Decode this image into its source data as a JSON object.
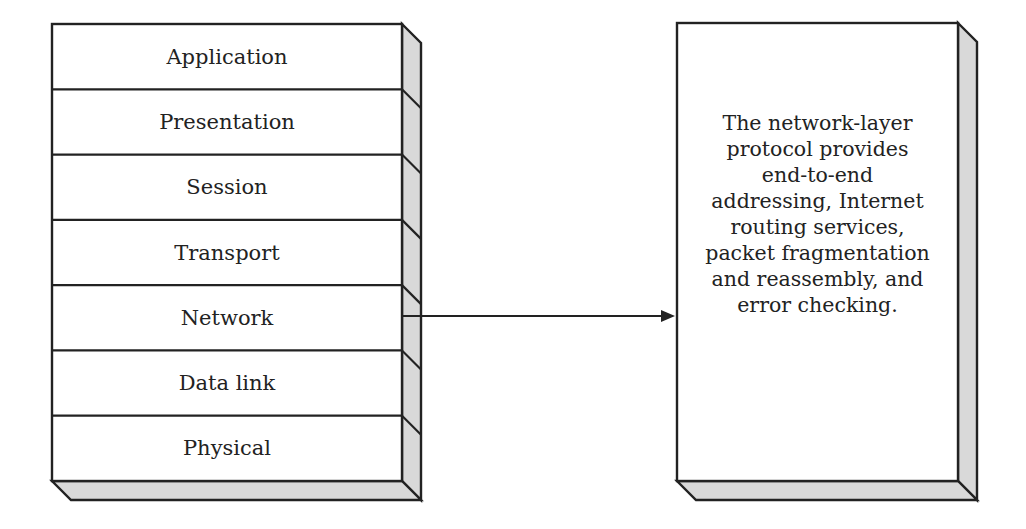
{
  "diagram": {
    "stack": {
      "name": "osi-layer-stack",
      "layers": [
        {
          "label": "Application"
        },
        {
          "label": "Presentation"
        },
        {
          "label": "Session"
        },
        {
          "label": "Transport"
        },
        {
          "label": "Network"
        },
        {
          "label": "Data link"
        },
        {
          "label": "Physical"
        }
      ],
      "highlighted_layer": "Network"
    },
    "description_box": {
      "text": "The network-layer\nprotocol provides\nend-to-end\naddressing, Internet\nrouting services,\npacket fragmentation\nand reassembly, and\nerror checking."
    },
    "connector": {
      "from": "Network",
      "to": "description_box",
      "type": "arrow"
    },
    "colors": {
      "stroke": "#222222",
      "face": "#ffffff",
      "side_shading": "#d9d9d9"
    }
  }
}
